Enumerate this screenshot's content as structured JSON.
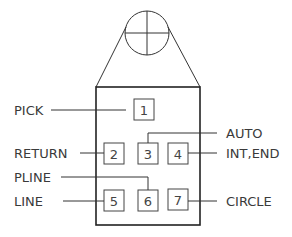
{
  "diagram": {
    "buttons": [
      {
        "number": "1",
        "function": "PICK"
      },
      {
        "number": "2",
        "function": "RETURN"
      },
      {
        "number": "3",
        "function": "AUTO"
      },
      {
        "number": "4",
        "function": "INT,END"
      },
      {
        "number": "5",
        "function": "LINE"
      },
      {
        "number": "6",
        "function": "PLINE"
      },
      {
        "number": "7",
        "function": "CIRCLE"
      }
    ],
    "labels": {
      "pick": "PICK",
      "return": "RETURN",
      "auto": "AUTO",
      "int_end": "INT,END",
      "pline": "PLINE",
      "line": "LINE",
      "circle": "CIRCLE"
    }
  }
}
